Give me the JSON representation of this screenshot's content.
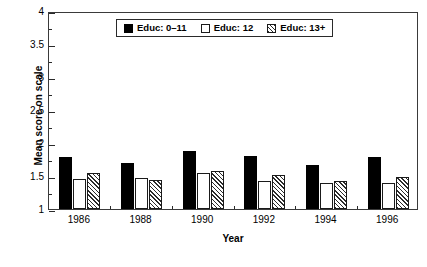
{
  "chart_data": {
    "type": "bar",
    "title": "",
    "subtitle": "",
    "xlabel": "Year",
    "ylabel": "Mean score on scale",
    "categories": [
      "1986",
      "1988",
      "1990",
      "1992",
      "1994",
      "1996"
    ],
    "series": [
      {
        "name": "Educ: 0–11",
        "style": "solid-black",
        "color": "#000000",
        "values": [
          1.79,
          1.69,
          1.88,
          1.81,
          1.66,
          1.79
        ]
      },
      {
        "name": "Educ: 12",
        "style": "open-white",
        "color": "#ffffff",
        "values": [
          1.45,
          1.47,
          1.54,
          1.42,
          1.39,
          1.39
        ]
      },
      {
        "name": "Educ: 13+",
        "style": "diagonal-hatch",
        "color": "#2b2b2b",
        "values": [
          1.54,
          1.44,
          1.58,
          1.52,
          1.43,
          1.49
        ]
      }
    ],
    "ylim": [
      1,
      4
    ],
    "xlim_categories": 6,
    "ytick_labels": [
      "1",
      "1.5",
      "2",
      "2.5",
      "3",
      "3.5",
      "4"
    ],
    "ytick_values": [
      1,
      1.5,
      2,
      2.5,
      3,
      3.5,
      4
    ],
    "yminor_step": 0.25,
    "grid": false,
    "legend_position": "top-center",
    "frame": "box"
  },
  "legend": {
    "entries": [
      {
        "label": "Educ: 0–11"
      },
      {
        "label": "Educ: 12"
      },
      {
        "label": "Educ: 13+"
      }
    ]
  },
  "axes": {
    "y_title": "Mean score on scale",
    "x_title": "Year"
  }
}
